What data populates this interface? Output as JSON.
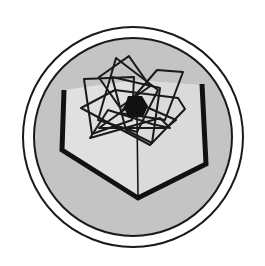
{
  "emblem": {
    "shape": "circular-badge",
    "colors": {
      "background": "#ffffff",
      "outer_ring_fill": "#ffffff",
      "outline": "#1a1a1a",
      "disk_fill": "#c4c4c4",
      "book_fill": "#e2e2e2",
      "book_shadow": "#d4d4d4",
      "hexagon_fill": "#111111"
    },
    "elements": [
      "outer-ring",
      "inner-disk",
      "open-book",
      "book-spine",
      "star-pattern",
      "center-hexagon"
    ]
  }
}
